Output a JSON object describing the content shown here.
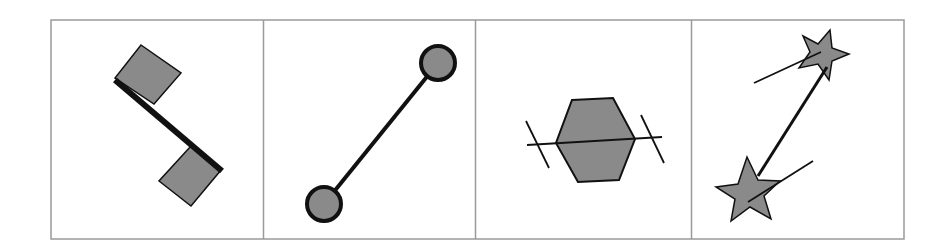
{
  "figure": {
    "panels": [
      {
        "id": "panel-1",
        "shape": "square",
        "description": "Two rotated squares joined by a thick line segment attached along their edges"
      },
      {
        "id": "panel-2",
        "shape": "circle",
        "description": "Two circles connected by a line between their centers"
      },
      {
        "id": "panel-3",
        "shape": "hexagon",
        "description": "Single hexagon with a line through it and perpendicular tick marks at each end"
      },
      {
        "id": "panel-4",
        "shape": "star",
        "description": "Two stars connected by a line, each with a short orientation line"
      }
    ],
    "colors": {
      "fill": "#8a8a8a",
      "stroke": "#111111",
      "frame": "#9a9a9a",
      "background": "#ffffff"
    }
  }
}
